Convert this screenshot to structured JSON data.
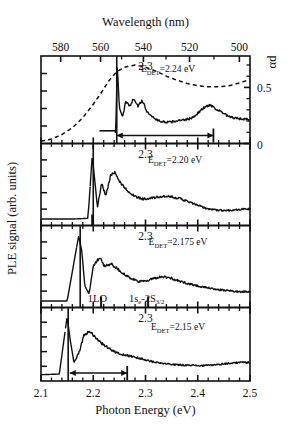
{
  "figure": {
    "top_axis": {
      "title": "Wavelength (nm)",
      "ticks": [
        "580",
        "560",
        "540",
        "520",
        "500"
      ],
      "tick_values": [
        580,
        560,
        540,
        520,
        500
      ]
    },
    "bottom_axis": {
      "title": "Photon Energy (eV)",
      "ticks": [
        "2.1",
        "2.2",
        "2.3",
        "2.4",
        "2.5"
      ],
      "tick_values": [
        2.1,
        2.2,
        2.3,
        2.4,
        2.5
      ],
      "range": [
        2.1,
        2.5
      ]
    },
    "left_axis": {
      "title": "PLE signal (arb. units)"
    },
    "right_axis": {
      "title": "αd",
      "ticks": [
        "0.5",
        "0"
      ],
      "tick_values": [
        0.5,
        0
      ]
    },
    "panel_inner_label": "2.3",
    "panels": [
      {
        "id": "panel-1",
        "detection_label": "E_DET=2.24 eV",
        "det_prefix": "E",
        "det_sub": "DET",
        "det_suffix": "=2.24 eV",
        "detection_energy": 2.24,
        "has_absorption_curve": true,
        "arrow": {
          "from": 2.245,
          "to": 2.43
        }
      },
      {
        "id": "panel-2",
        "detection_label": "E_DET=2.20 eV",
        "det_prefix": "E",
        "det_sub": "DET",
        "det_suffix": "=2.20 eV",
        "detection_energy": 2.2,
        "has_absorption_curve": false,
        "arrow": null
      },
      {
        "id": "panel-3",
        "detection_label": "E_DET=2.175 eV",
        "det_prefix": "E",
        "det_sub": "DET",
        "det_suffix": "=2.175 eV",
        "detection_energy": 2.175,
        "has_absorption_curve": false,
        "arrow": null,
        "peak_labels": [
          {
            "text": "1LO",
            "energy": 2.215
          },
          {
            "text_prefix": "1s",
            "text_sub1": "e",
            "text_mid": "-2S",
            "text_sub2": "3/2",
            "energy": 2.305
          }
        ]
      },
      {
        "id": "panel-4",
        "detection_label": "E_DET=2.15 eV",
        "det_prefix": "E",
        "det_sub": "DET",
        "det_suffix": "=2.15 eV",
        "detection_energy": 2.15,
        "has_absorption_curve": false,
        "arrow": {
          "from": 2.155,
          "to": 2.265
        }
      }
    ]
  },
  "chart_data": {
    "type": "line",
    "title": "",
    "xlabel": "Photon Energy (eV)",
    "ylabel": "PLE signal (arb. units)",
    "xlim": [
      2.1,
      2.5
    ],
    "secondary_xaxis": {
      "label": "Wavelength (nm)",
      "ticks": [
        580,
        560,
        540,
        520,
        500
      ]
    },
    "secondary_yaxis": {
      "label": "αd",
      "ticks": [
        0,
        0.5
      ],
      "ylim": [
        0,
        0.78
      ]
    },
    "grid": false,
    "legend": "none",
    "panel_count": 4,
    "series": [
      {
        "name": "absorption (alpha-d)",
        "panel": 1,
        "style": "dashed",
        "axis": "right",
        "x": [
          2.1,
          2.12,
          2.14,
          2.16,
          2.18,
          2.2,
          2.215,
          2.23,
          2.245,
          2.26,
          2.28,
          2.3,
          2.32,
          2.34,
          2.36,
          2.38,
          2.4,
          2.42,
          2.44,
          2.46,
          2.48,
          2.5
        ],
        "y": [
          0.02,
          0.04,
          0.08,
          0.14,
          0.23,
          0.35,
          0.45,
          0.56,
          0.64,
          0.68,
          0.7,
          0.68,
          0.645,
          0.6,
          0.565,
          0.535,
          0.515,
          0.505,
          0.505,
          0.515,
          0.54,
          0.57
        ]
      },
      {
        "name": "PLE E_DET=2.24 eV",
        "panel": 1,
        "style": "solid",
        "axis": "left",
        "x": [
          2.1,
          2.15,
          2.2,
          2.232,
          2.243,
          2.246,
          2.25,
          2.256,
          2.262,
          2.27,
          2.278,
          2.286,
          2.294,
          2.302,
          2.31,
          2.32,
          2.33,
          2.345,
          2.36,
          2.375,
          2.39,
          2.4,
          2.412,
          2.424,
          2.436,
          2.448,
          2.46,
          2.475,
          2.49,
          2.5
        ],
        "y": [
          0.06,
          0.06,
          0.06,
          0.07,
          0.08,
          0.95,
          0.4,
          0.28,
          0.47,
          0.43,
          0.52,
          0.42,
          0.49,
          0.36,
          0.3,
          0.25,
          0.22,
          0.21,
          0.23,
          0.24,
          0.27,
          0.33,
          0.4,
          0.44,
          0.38,
          0.33,
          0.28,
          0.26,
          0.25,
          0.25
        ]
      },
      {
        "name": "PLE E_DET=2.20 eV",
        "panel": 2,
        "style": "solid",
        "axis": "left",
        "x": [
          2.1,
          2.16,
          2.19,
          2.198,
          2.203,
          2.208,
          2.216,
          2.224,
          2.233,
          2.241,
          2.25,
          2.258,
          2.268,
          2.28,
          2.295,
          2.312,
          2.33,
          2.35,
          2.368,
          2.385,
          2.4,
          2.415,
          2.43,
          2.445,
          2.46,
          2.475,
          2.49,
          2.5
        ],
        "y": [
          0.02,
          0.02,
          0.03,
          0.9,
          0.55,
          0.18,
          0.52,
          0.34,
          0.62,
          0.66,
          0.55,
          0.47,
          0.4,
          0.33,
          0.3,
          0.31,
          0.33,
          0.33,
          0.3,
          0.25,
          0.21,
          0.17,
          0.15,
          0.14,
          0.14,
          0.15,
          0.16,
          0.16
        ]
      },
      {
        "name": "PLE E_DET=2.175 eV",
        "panel": 3,
        "style": "solid",
        "axis": "left",
        "x": [
          2.1,
          2.15,
          2.172,
          2.178,
          2.184,
          2.192,
          2.2,
          2.212,
          2.222,
          2.234,
          2.246,
          2.258,
          2.272,
          2.288,
          2.302,
          2.318,
          2.332,
          2.348,
          2.362,
          2.378,
          2.395,
          2.412,
          2.43,
          2.448,
          2.465,
          2.48,
          2.5
        ],
        "y": [
          0.02,
          0.02,
          0.92,
          0.72,
          0.22,
          0.12,
          0.5,
          0.62,
          0.5,
          0.54,
          0.47,
          0.4,
          0.33,
          0.29,
          0.3,
          0.34,
          0.36,
          0.34,
          0.3,
          0.27,
          0.24,
          0.21,
          0.19,
          0.17,
          0.16,
          0.15,
          0.15
        ]
      },
      {
        "name": "PLE E_DET=2.15 eV",
        "panel": 4,
        "style": "solid",
        "axis": "left",
        "x": [
          2.1,
          2.135,
          2.15,
          2.156,
          2.163,
          2.172,
          2.182,
          2.192,
          2.202,
          2.214,
          2.226,
          2.24,
          2.255,
          2.27,
          2.286,
          2.3,
          2.318,
          2.336,
          2.352,
          2.368,
          2.385,
          2.4,
          2.415,
          2.428,
          2.44,
          2.452,
          2.465,
          2.48,
          2.5
        ],
        "y": [
          0.02,
          0.03,
          0.92,
          0.55,
          0.22,
          0.34,
          0.62,
          0.7,
          0.62,
          0.52,
          0.45,
          0.38,
          0.33,
          0.31,
          0.28,
          0.25,
          0.21,
          0.19,
          0.18,
          0.17,
          0.17,
          0.16,
          0.16,
          0.17,
          0.18,
          0.19,
          0.2,
          0.21,
          0.21
        ]
      }
    ],
    "annotations": [
      {
        "text": "E_DET=2.24 eV",
        "panel": 1
      },
      {
        "text": "E_DET=2.20 eV",
        "panel": 2
      },
      {
        "text": "E_DET=2.175 eV",
        "panel": 3
      },
      {
        "text": "1LO",
        "panel": 3
      },
      {
        "text": "1s_e-2S_3/2",
        "panel": 3
      },
      {
        "text": "E_DET=2.15 eV",
        "panel": 4
      },
      {
        "text": "2.3",
        "panel": "all"
      }
    ]
  }
}
